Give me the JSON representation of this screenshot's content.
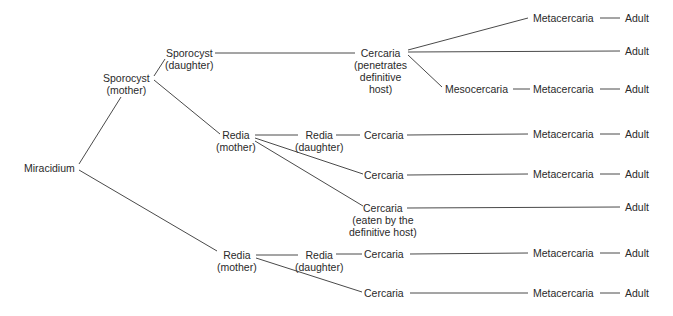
{
  "diagram": {
    "nodes": {
      "miracidium": {
        "label": "Miracidium"
      },
      "sporocyst_mother": {
        "label": "Sporocyst",
        "sub": "(mother)"
      },
      "sporocyst_daughter": {
        "label": "Sporocyst",
        "sub": "(daughter)"
      },
      "cercaria_penetrates": {
        "label": "Cercaria",
        "sub1": "(penetrates",
        "sub2": "definitive",
        "sub3": "host)"
      },
      "metacercaria_1": {
        "label": "Metacercaria"
      },
      "adult_1": {
        "label": "Adult"
      },
      "adult_2": {
        "label": "Adult"
      },
      "mesocercaria": {
        "label": "Mesocercaria"
      },
      "metacercaria_2": {
        "label": "Metacercaria"
      },
      "adult_3": {
        "label": "Adult"
      },
      "redia_mother_1": {
        "label": "Redia",
        "sub": "(mother)"
      },
      "redia_daughter_1": {
        "label": "Redia",
        "sub": "(daughter)"
      },
      "cercaria_2": {
        "label": "Cercaria"
      },
      "metacercaria_3": {
        "label": "Metacercaria"
      },
      "adult_4": {
        "label": "Adult"
      },
      "cercaria_3": {
        "label": "Cercaria"
      },
      "metacercaria_4": {
        "label": "Metacercaria"
      },
      "adult_5": {
        "label": "Adult"
      },
      "cercaria_eaten": {
        "label": "Cercaria",
        "sub1": "(eaten by the",
        "sub2": "definitive host)"
      },
      "adult_6": {
        "label": "Adult"
      },
      "redia_mother_2": {
        "label": "Redia",
        "sub": "(mother)"
      },
      "redia_daughter_2": {
        "label": "Redia",
        "sub": "(daughter)"
      },
      "cercaria_4": {
        "label": "Cercaria"
      },
      "metacercaria_5": {
        "label": "Metacercaria"
      },
      "adult_7": {
        "label": "Adult"
      },
      "cercaria_5": {
        "label": "Cercaria"
      },
      "metacercaria_6": {
        "label": "Metacercaria"
      },
      "adult_8": {
        "label": "Adult"
      }
    },
    "edges": [
      [
        "miracidium",
        "sporocyst_mother"
      ],
      [
        "miracidium",
        "redia_mother_2"
      ],
      [
        "sporocyst_mother",
        "sporocyst_daughter"
      ],
      [
        "sporocyst_mother",
        "redia_mother_1"
      ],
      [
        "sporocyst_daughter",
        "cercaria_penetrates"
      ],
      [
        "cercaria_penetrates",
        "metacercaria_1"
      ],
      [
        "metacercaria_1",
        "adult_1"
      ],
      [
        "cercaria_penetrates",
        "adult_2"
      ],
      [
        "cercaria_penetrates",
        "mesocercaria"
      ],
      [
        "mesocercaria",
        "metacercaria_2"
      ],
      [
        "metacercaria_2",
        "adult_3"
      ],
      [
        "redia_mother_1",
        "redia_daughter_1"
      ],
      [
        "redia_daughter_1",
        "cercaria_2"
      ],
      [
        "cercaria_2",
        "metacercaria_3"
      ],
      [
        "metacercaria_3",
        "adult_4"
      ],
      [
        "redia_mother_1",
        "cercaria_3"
      ],
      [
        "cercaria_3",
        "metacercaria_4"
      ],
      [
        "metacercaria_4",
        "adult_5"
      ],
      [
        "redia_mother_1",
        "cercaria_eaten"
      ],
      [
        "cercaria_eaten",
        "adult_6"
      ],
      [
        "redia_mother_2",
        "redia_daughter_2"
      ],
      [
        "redia_daughter_2",
        "cercaria_4"
      ],
      [
        "cercaria_4",
        "metacercaria_5"
      ],
      [
        "metacercaria_5",
        "adult_7"
      ],
      [
        "redia_mother_2",
        "cercaria_5"
      ],
      [
        "cercaria_5",
        "metacercaria_6"
      ],
      [
        "metacercaria_6",
        "adult_8"
      ]
    ],
    "colors": {
      "line": "#4a4a4a",
      "text": "#2a2a2a",
      "background": "#ffffff"
    }
  }
}
